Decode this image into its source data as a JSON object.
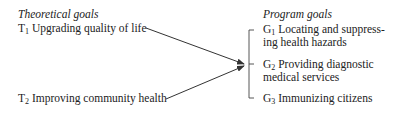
{
  "left": {
    "heading": "Theoretical goals",
    "items": [
      {
        "symbol": "T",
        "sub": "1",
        "label": "Upgrading quality of life"
      },
      {
        "symbol": "T",
        "sub": "2",
        "label": "Improving community health"
      }
    ]
  },
  "right": {
    "heading": "Program goals",
    "items": [
      {
        "symbol": "G",
        "sub": "1",
        "line1": "Locating and suppress-",
        "line2": "ing health hazards"
      },
      {
        "symbol": "G",
        "sub": "2",
        "line1": "Providing diagnostic",
        "line2": "medical services"
      },
      {
        "symbol": "G",
        "sub": "3",
        "line1": "Immunizing citizens",
        "line2": ""
      }
    ]
  },
  "colors": {
    "text": "#222222",
    "lines": "#333333"
  }
}
